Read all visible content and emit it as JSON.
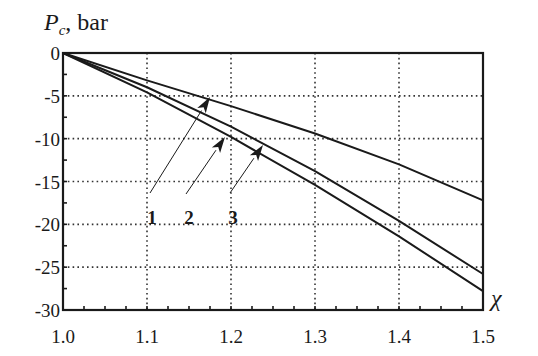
{
  "chart_data": {
    "type": "line",
    "title": "",
    "ylabel": "P_c, bar",
    "ylabel_main": "P",
    "ylabel_sub": "c",
    "ylabel_unit": ", bar",
    "xlabel": "χ",
    "xlim": [
      1.0,
      1.5
    ],
    "ylim": [
      -30,
      0
    ],
    "xticks": [
      "1.0",
      "1.1",
      "1.2",
      "1.3",
      "1.4",
      "1.5"
    ],
    "yticks": [
      "0",
      "-5",
      "-10",
      "-15",
      "-20",
      "-25",
      "-30"
    ],
    "grid": true,
    "grid_style": "dotted",
    "legend": "none (curves labeled 1, 2, 3 with arrows)",
    "x": [
      1.0,
      1.1,
      1.2,
      1.3,
      1.4,
      1.5
    ],
    "series": [
      {
        "name": "1",
        "values": [
          0,
          -3.2,
          -6.2,
          -9.4,
          -13.0,
          -17.2
        ]
      },
      {
        "name": "3",
        "values": [
          0,
          -4.0,
          -8.6,
          -13.8,
          -19.6,
          -25.8
        ]
      },
      {
        "name": "2",
        "values": [
          0,
          -4.6,
          -9.8,
          -15.4,
          -21.4,
          -27.8
        ]
      }
    ],
    "annotations": [
      {
        "label": "1",
        "points_to_series": "1"
      },
      {
        "label": "2",
        "points_to_series": "2"
      },
      {
        "label": "3",
        "points_to_series": "3"
      }
    ]
  },
  "style": {
    "line_color": "#1a1a1a",
    "grid_color": "#333333",
    "background": "#ffffff"
  }
}
